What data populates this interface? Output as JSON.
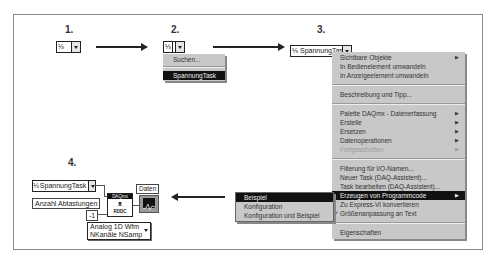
{
  "steps": {
    "s1": "1.",
    "s2": "2.",
    "s3": "3.",
    "s4": "4."
  },
  "step1": {
    "control_icon": "task-icon",
    "control_text": ""
  },
  "step2": {
    "control_icon": "task-icon",
    "menu": [
      {
        "label": "Suchen...",
        "selected": false
      },
      {
        "label": "SpannungTask",
        "selected": true
      }
    ]
  },
  "step3": {
    "control_text": "SpannungTask",
    "menu": {
      "i0": "Sichtbare Objekte",
      "i1": "In Bedienelement umwandeln",
      "i2": "In Anzeigeelement umwandeln",
      "i3": "Beschreibung und Tipp...",
      "i4": "Palette DAQmx - Datenerfassung",
      "i5": "Erstelle",
      "i6": "Ersetzen",
      "i7": "Datenoperationen",
      "i8": "Fortgeschritten",
      "i9": "Filterung für I/O-Namen...",
      "i10": "Neuer Task (DAQ-Assistent)...",
      "i11": "Task bearbeiten (DAQ-Assistent)...",
      "i12": "Erzeugen von Programmcode",
      "i13": "Zu Express-VI konvertieren",
      "i14": "Größenanpassung an Text",
      "i15": "Eigenschaften",
      "submenu_arrow": "▶",
      "checkmark": "✓"
    },
    "submenu": {
      "i0": "Beispiel",
      "i1": "Konfiguration",
      "i2": "Konfiguration und Beispiel"
    }
  },
  "step4": {
    "task_control": "SpannungTask",
    "samples_label": "Anzahl Abtastungen",
    "samples_value": "-1",
    "vi_header": "DAQmx",
    "vi_glyph": "ᴥ",
    "vi_footer": "RDDC",
    "output_label": "Daten",
    "selector_line1": "Analog 1D Wfm",
    "selector_line2": "NKanäle NSamp"
  },
  "colors": {
    "menu_bg": "#c8c8c8",
    "selected_bg": "#111111",
    "frame": "#8a8a8a"
  }
}
